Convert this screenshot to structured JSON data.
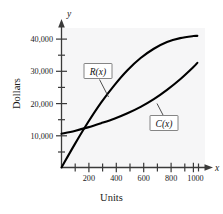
{
  "chart_data": {
    "type": "line",
    "title": "",
    "xlabel": "Units",
    "ylabel": "Dollars",
    "x_axis_symbol": "x",
    "y_axis_symbol": "y",
    "xlim": [
      0,
      1100
    ],
    "ylim": [
      0,
      45000
    ],
    "x_ticks_major": [
      200,
      400,
      600,
      800,
      1000
    ],
    "x_tick_labels": [
      "200",
      "400",
      "600",
      "800",
      "1000"
    ],
    "x_ticks_minor": [
      100,
      300,
      500,
      700,
      900,
      1100
    ],
    "y_ticks_major": [
      10000,
      20000,
      30000,
      40000
    ],
    "y_tick_labels": [
      "10,000",
      "20,000",
      "30,000",
      "40,000"
    ],
    "y_ticks_minor": [
      5000,
      15000,
      25000,
      35000
    ],
    "grid": false,
    "legend_position": "inline-callouts",
    "series": [
      {
        "name": "R(x)",
        "label": "R(x)",
        "color": "#000000",
        "description": "Revenue curve, concave increasing from origin, flattening near 41,000",
        "points": [
          [
            0,
            0
          ],
          [
            100,
            7200
          ],
          [
            200,
            14000
          ],
          [
            300,
            20200
          ],
          [
            400,
            25600
          ],
          [
            500,
            30300
          ],
          [
            600,
            34100
          ],
          [
            700,
            37000
          ],
          [
            800,
            39100
          ],
          [
            900,
            40300
          ],
          [
            1000,
            40950
          ],
          [
            1030,
            41000
          ]
        ]
      },
      {
        "name": "C(x)",
        "label": "C(x)",
        "color": "#000000",
        "description": "Cost curve starting near 10,500, nearly linear then increasing more steeply",
        "points": [
          [
            0,
            10500
          ],
          [
            100,
            11400
          ],
          [
            200,
            12500
          ],
          [
            300,
            13800
          ],
          [
            400,
            15200
          ],
          [
            500,
            16900
          ],
          [
            600,
            18900
          ],
          [
            700,
            21300
          ],
          [
            800,
            24200
          ],
          [
            900,
            27500
          ],
          [
            1000,
            31300
          ],
          [
            1030,
            32600
          ]
        ]
      }
    ],
    "annotations": [
      {
        "text": "R(x)",
        "kind": "boxed-callout",
        "anchor_units": [
          330,
          21500
        ],
        "box_units": [
          215,
          30800
        ]
      },
      {
        "text": "C(x)",
        "kind": "boxed-callout",
        "anchor_units": [
          700,
          21300
        ],
        "box_units": [
          735,
          15200
        ]
      }
    ],
    "intersection_approx": [
      170,
      12000
    ]
  }
}
